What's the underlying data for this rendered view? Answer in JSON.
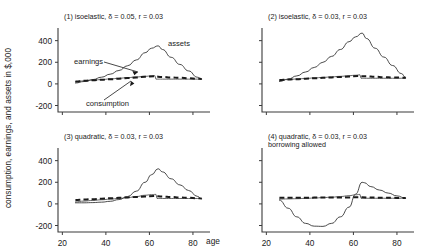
{
  "figure": {
    "ylabel": "consumption, earnings, and assets in $,000",
    "xlabel": "age",
    "yticks": [
      "400",
      "200",
      "0",
      "-200"
    ],
    "xticks": [
      "20",
      "40",
      "60",
      "80"
    ]
  },
  "panels": [
    {
      "id": "panel-1",
      "title": "(1) isoelastic, δ = 0.05, r = 0.03",
      "title2": "",
      "annotations": [
        {
          "name": "assets-label",
          "text": "assets"
        },
        {
          "name": "earnings-label",
          "text": "earnings"
        },
        {
          "name": "consumption-label",
          "text": "consumption"
        }
      ]
    },
    {
      "id": "panel-2",
      "title": "(2) isoelastic, δ = 0.03, r = 0.03",
      "title2": "",
      "annotations": []
    },
    {
      "id": "panel-3",
      "title": "(3) quadratic, δ = 0.03, r = 0.03",
      "title2": "",
      "annotations": []
    },
    {
      "id": "panel-4",
      "title": "(4) quadratic, δ = 0.03, r = 0.03",
      "title2": "borrowing allowed",
      "annotations": []
    }
  ],
  "chart_data": {
    "type": "line",
    "xlabel": "age",
    "ylabel": "consumption, earnings, and assets in $,000",
    "xlim": [
      18,
      86
    ],
    "ylim": [
      -260,
      480
    ],
    "xticks": [
      20,
      40,
      60,
      80
    ],
    "yticks": [
      -200,
      0,
      200,
      400
    ],
    "grid": false,
    "legend": "annotated-inline",
    "units": "thousands of dollars",
    "panels": [
      {
        "name": "(1) isoelastic, δ = 0.05, r = 0.03",
        "series": [
          {
            "name": "assets",
            "style": "thin-solid",
            "x": [
              26,
              30,
              34,
              38,
              42,
              46,
              50,
              54,
              58,
              61,
              64,
              66,
              70,
              74,
              78,
              82,
              84
            ],
            "values": [
              8,
              22,
              40,
              62,
              90,
              124,
              168,
              222,
              288,
              330,
              352,
              318,
              246,
              180,
              120,
              62,
              44
            ]
          },
          {
            "name": "earnings",
            "style": "thin-solid",
            "x": [
              26,
              30,
              34,
              38,
              42,
              46,
              50,
              54,
              58,
              61,
              62.5,
              63,
              66,
              70,
              74,
              78,
              82,
              84
            ],
            "values": [
              20,
              28,
              34,
              40,
              46,
              52,
              58,
              64,
              70,
              74,
              76,
              44,
              44,
              44,
              44,
              44,
              44,
              44
            ]
          },
          {
            "name": "consumption",
            "style": "thick-dashed",
            "x": [
              26,
              30,
              34,
              38,
              42,
              46,
              50,
              54,
              58,
              62,
              66,
              70,
              74,
              78,
              82,
              84
            ],
            "values": [
              22,
              28,
              33,
              38,
              43,
              48,
              54,
              60,
              66,
              70,
              64,
              60,
              56,
              52,
              48,
              46
            ]
          }
        ]
      },
      {
        "name": "(2) isoelastic, δ = 0.03, r = 0.03",
        "series": [
          {
            "name": "assets",
            "style": "thin-solid",
            "x": [
              26,
              30,
              34,
              38,
              42,
              46,
              50,
              54,
              58,
              61,
              64,
              66,
              70,
              74,
              78,
              82,
              84
            ],
            "values": [
              22,
              44,
              74,
              110,
              152,
              200,
              255,
              318,
              390,
              435,
              470,
              420,
              330,
              248,
              170,
              96,
              58
            ]
          },
          {
            "name": "earnings",
            "style": "thin-solid",
            "x": [
              26,
              30,
              34,
              38,
              42,
              46,
              50,
              54,
              58,
              61,
              63,
              63.5,
              66,
              70,
              74,
              78,
              82,
              84
            ],
            "values": [
              34,
              40,
              45,
              50,
              55,
              60,
              65,
              70,
              76,
              80,
              84,
              52,
              52,
              52,
              52,
              52,
              52,
              52
            ]
          },
          {
            "name": "consumption",
            "style": "thick-dashed",
            "x": [
              26,
              30,
              34,
              38,
              42,
              46,
              50,
              54,
              58,
              62,
              66,
              70,
              74,
              78,
              82,
              84
            ],
            "values": [
              36,
              40,
              44,
              48,
              52,
              56,
              60,
              64,
              68,
              72,
              70,
              66,
              62,
              60,
              58,
              56
            ]
          }
        ]
      },
      {
        "name": "(3) quadratic, δ = 0.03, r = 0.03",
        "series": [
          {
            "name": "assets",
            "style": "thin-solid",
            "x": [
              26,
              30,
              34,
              38,
              42,
              46,
              50,
              54,
              58,
              61,
              64,
              66,
              70,
              74,
              78,
              82,
              84
            ],
            "values": [
              10,
              10,
              12,
              16,
              24,
              40,
              68,
              118,
              200,
              270,
              325,
              296,
              232,
              176,
              124,
              70,
              46
            ]
          },
          {
            "name": "earnings",
            "style": "thin-solid",
            "x": [
              26,
              30,
              34,
              38,
              42,
              46,
              50,
              54,
              58,
              61,
              63,
              63.5,
              66,
              70,
              74,
              78,
              82,
              84
            ],
            "values": [
              18,
              26,
              32,
              38,
              44,
              50,
              58,
              68,
              80,
              86,
              88,
              50,
              50,
              50,
              50,
              50,
              50,
              50
            ]
          },
          {
            "name": "consumption",
            "style": "thick-dashed",
            "x": [
              26,
              30,
              34,
              38,
              42,
              46,
              50,
              54,
              58,
              62,
              66,
              70,
              74,
              78,
              82,
              84
            ],
            "values": [
              36,
              40,
              44,
              48,
              52,
              56,
              60,
              64,
              68,
              72,
              68,
              64,
              60,
              56,
              52,
              50
            ]
          }
        ]
      },
      {
        "name": "(4) quadratic, δ = 0.03, r = 0.03 borrowing allowed",
        "series": [
          {
            "name": "assets",
            "style": "thin-solid",
            "x": [
              26,
              30,
              34,
              38,
              42,
              46,
              50,
              54,
              58,
              61,
              64,
              65,
              68,
              72,
              76,
              80,
              84
            ],
            "values": [
              36,
              -40,
              -120,
              -180,
              -206,
              -208,
              -180,
              -120,
              -30,
              90,
              200,
              196,
              160,
              128,
              100,
              74,
              52
            ]
          },
          {
            "name": "earnings",
            "style": "thin-solid",
            "x": [
              26,
              30,
              34,
              38,
              42,
              46,
              50,
              54,
              58,
              61,
              63,
              63.5,
              66,
              70,
              74,
              78,
              82,
              84
            ],
            "values": [
              44,
              46,
              48,
              51,
              54,
              58,
              62,
              68,
              76,
              84,
              88,
              52,
              52,
              52,
              52,
              52,
              52,
              52
            ]
          },
          {
            "name": "consumption",
            "style": "thick-dashed",
            "x": [
              26,
              30,
              34,
              38,
              42,
              46,
              50,
              54,
              58,
              62,
              66,
              70,
              74,
              78,
              82,
              84
            ],
            "values": [
              56,
              56,
              57,
              57,
              58,
              58,
              59,
              60,
              60,
              62,
              60,
              58,
              57,
              56,
              55,
              54
            ]
          }
        ]
      }
    ]
  }
}
